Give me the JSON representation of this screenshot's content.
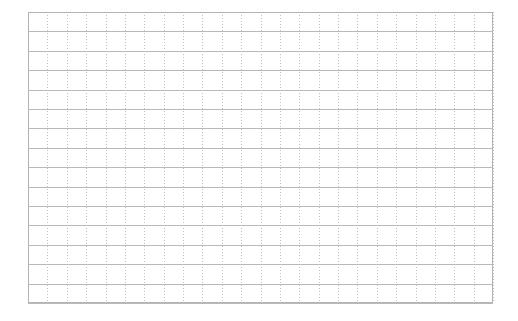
{
  "page": {
    "background_color": "#ffffff",
    "width": 518,
    "height": 321
  },
  "grid": {
    "name": "empty-graph-paper-grid",
    "origin_x": 28,
    "origin_y": 12,
    "width": 465,
    "height": 291,
    "columns": 24,
    "rows": 15,
    "cell_width": 19.375,
    "cell_height": 19.4,
    "horizontal_line_color": "#b9b9b9",
    "horizontal_line_style": "solid",
    "vertical_line_color": "#bfbfbf",
    "vertical_line_style": "dotted",
    "border_color": "#b3b3b3",
    "content": ""
  },
  "chart_data": {
    "type": "table",
    "title": "",
    "xlabel": "",
    "ylabel": "",
    "categories": [],
    "values": [],
    "grid": true,
    "legend": "none",
    "annotations": []
  }
}
